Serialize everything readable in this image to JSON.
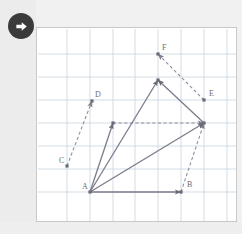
{
  "app": {
    "title": "Vector diagram worksheet",
    "background_color": "#f1f1f1",
    "panel_background": "#ffffff",
    "panel_border_color": "#c9c9c9"
  },
  "badge": {
    "name": "next-step-badge",
    "icon": "arrow-right-icon",
    "circle_color": "#3b3b3b",
    "arrow_color": "#ffffff",
    "label": "Next"
  },
  "grid": {
    "line_color": "#c8d4e0",
    "spacing_px": 22.7,
    "x_lines": [
      66,
      89,
      112,
      134,
      157,
      180,
      203,
      226
    ],
    "y_lines": [
      53,
      76,
      99,
      122,
      145,
      168,
      191
    ],
    "show": true
  },
  "chart_data": {
    "type": "scatter",
    "title": "",
    "xlabel": "",
    "ylabel": "",
    "grid": true,
    "legend": null,
    "vector_color_solid": "#7b7b8a",
    "vector_color_dashed": "#8e8e9c",
    "point_color": "#6b6b78",
    "label_color": "#6e6e6e",
    "points": [
      {
        "id": "A",
        "label": "A",
        "x": 89,
        "y": 191,
        "label_x": 81,
        "label_y": 188,
        "labeled": true
      },
      {
        "id": "B",
        "label": "B",
        "x": 180,
        "y": 191,
        "label_x": 186,
        "label_y": 186,
        "labeled": true
      },
      {
        "id": "C",
        "label": "C",
        "x": 66,
        "y": 165,
        "label_x": 58,
        "label_y": 162,
        "labeled": true
      },
      {
        "id": "D",
        "label": "D",
        "x": 91,
        "y": 100,
        "label_x": 94,
        "label_y": 96,
        "labeled": true
      },
      {
        "id": "E",
        "label": "E",
        "x": 203,
        "y": 99,
        "label_x": 208,
        "label_y": 95,
        "labeled": true
      },
      {
        "id": "F",
        "label": "F",
        "x": 157,
        "y": 53,
        "label_x": 161,
        "label_y": 49,
        "labeled": true
      },
      {
        "id": "P1",
        "label": "",
        "x": 112,
        "y": 122,
        "labeled": false
      },
      {
        "id": "P2",
        "label": "",
        "x": 157,
        "y": 79,
        "labeled": false
      },
      {
        "id": "P3",
        "label": "",
        "x": 203,
        "y": 122,
        "labeled": false
      }
    ],
    "solid_vectors": [
      {
        "name": "A-to-B",
        "x1": 89,
        "y1": 191,
        "x2": 180,
        "y2": 191,
        "arrow": true
      },
      {
        "name": "A-to-P1",
        "x1": 89,
        "y1": 191,
        "x2": 112,
        "y2": 122,
        "arrow": true
      },
      {
        "name": "A-to-P2",
        "x1": 89,
        "y1": 191,
        "x2": 157,
        "y2": 79,
        "arrow": true
      },
      {
        "name": "A-to-P3",
        "x1": 89,
        "y1": 191,
        "x2": 203,
        "y2": 122,
        "arrow": true
      },
      {
        "name": "P3-to-P2",
        "x1": 203,
        "y1": 122,
        "x2": 157,
        "y2": 79,
        "arrow": true
      }
    ],
    "dashed_vectors": [
      {
        "name": "C-to-D",
        "x1": 66,
        "y1": 165,
        "x2": 91,
        "y2": 100,
        "arrow": true
      },
      {
        "name": "B-to-P3",
        "x1": 180,
        "y1": 191,
        "x2": 203,
        "y2": 122,
        "arrow": true
      },
      {
        "name": "E-to-F",
        "x1": 203,
        "y1": 99,
        "x2": 157,
        "y2": 53,
        "arrow": true
      },
      {
        "name": "P1-to-P3",
        "x1": 112,
        "y1": 122,
        "x2": 203,
        "y2": 122,
        "arrow": true
      }
    ]
  }
}
